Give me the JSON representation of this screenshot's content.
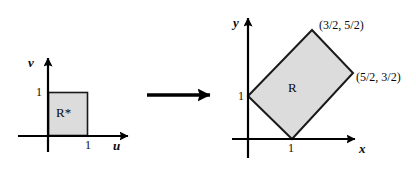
{
  "figure": {
    "background_color": "#ffffff",
    "stroke_color": "#000000",
    "fill_color": "#dcdcdc"
  },
  "left_plot": {
    "name": "uv-plane",
    "x_axis_label": "u",
    "y_axis_label": "v",
    "x_tick_label": "1",
    "y_tick_label": "1",
    "region_label": "R*",
    "region_shape": "square",
    "region_vertices": [
      [
        0,
        0
      ],
      [
        1,
        0
      ],
      [
        1,
        1
      ],
      [
        0,
        1
      ]
    ]
  },
  "arrow": {
    "name": "transformation-arrow",
    "direction": "right",
    "label": ""
  },
  "right_plot": {
    "name": "xy-plane",
    "x_axis_label": "x",
    "y_axis_label": "y",
    "x_tick_label": "1",
    "y_tick_label": "1",
    "region_label": "R",
    "region_shape": "rotated-rectangle",
    "vertex_labels": [
      {
        "text": "(3/2, 5/2)",
        "at_vertex": "top"
      },
      {
        "text": "(5/2, 3/2)",
        "at_vertex": "right"
      }
    ],
    "region_vertices": [
      [
        0,
        1
      ],
      [
        1,
        0
      ],
      [
        2.5,
        1.5
      ],
      [
        1.5,
        2.5
      ]
    ]
  }
}
